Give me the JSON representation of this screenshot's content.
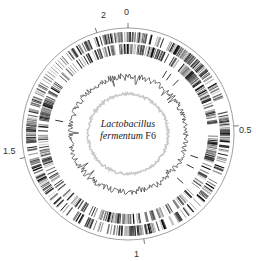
{
  "figure": {
    "organism_italic_line1": "Lactobacillus",
    "organism_italic_line2": "fermentum",
    "strain": "F6",
    "scale_labels": [
      {
        "label": "0",
        "position_mb": 0
      },
      {
        "label": "0.5",
        "position_mb": 0.5
      },
      {
        "label": "1",
        "position_mb": 1
      },
      {
        "label": "1.5",
        "position_mb": 1.5
      },
      {
        "label": "2",
        "position_mb": 2
      }
    ],
    "tracks": [
      "outer scale circle",
      "genes forward strand",
      "genes reverse strand",
      "RNA genes",
      "GC content",
      "GC skew"
    ],
    "colors": {
      "genes": "#222222",
      "gc_content": "#333333",
      "gc_skew": "#bbbbbb",
      "scale": "#888888"
    }
  }
}
